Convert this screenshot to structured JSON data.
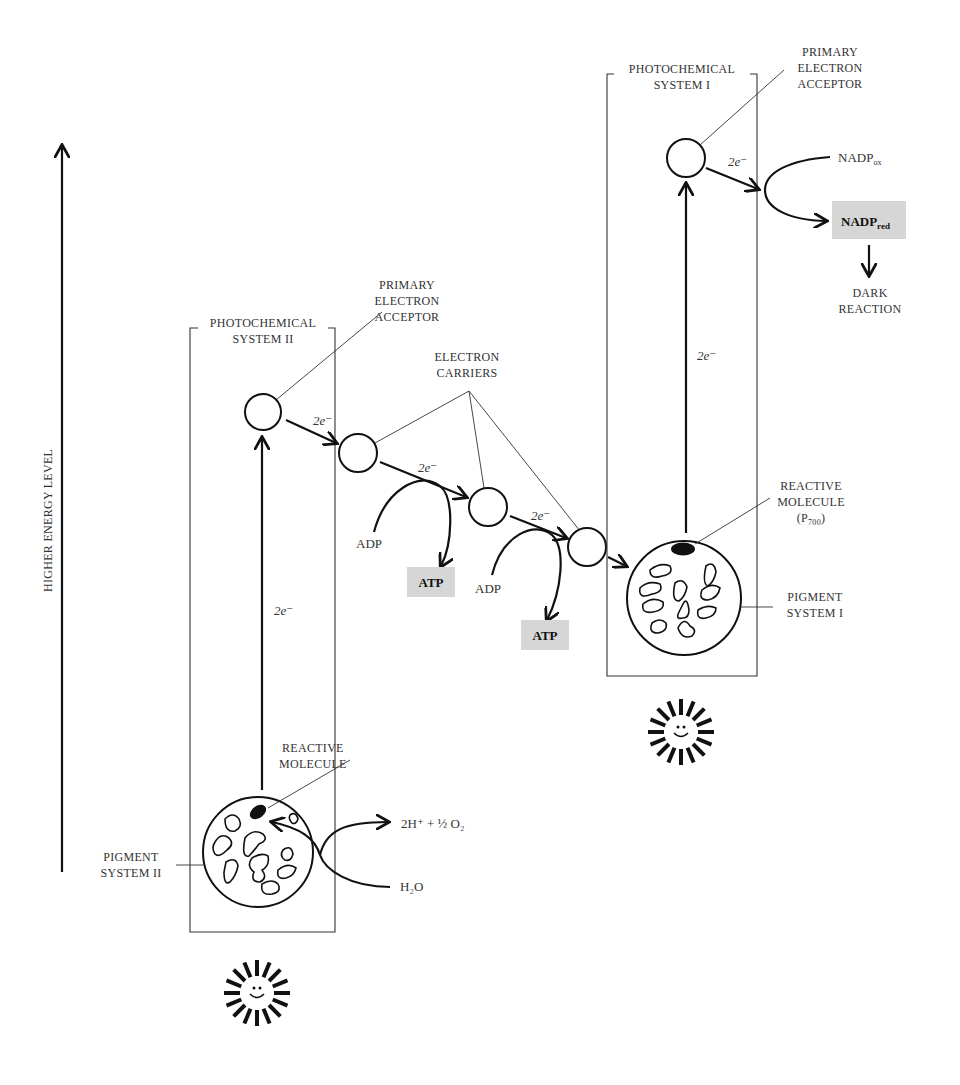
{
  "axis": {
    "label": "HIGHER ENERGY LEVEL",
    "direction": "up"
  },
  "photosystem_ii": {
    "title_line1": "PHOTOCHEMICAL",
    "title_line2": "SYSTEM II",
    "acceptor_label_line1": "PRIMARY",
    "acceptor_label_line2": "ELECTRON",
    "acceptor_label_line3": "ACCEPTOR",
    "excitation_label": "2e⁻",
    "reactive_label_line1": "REACTIVE",
    "reactive_label_line2": "MOLECULE",
    "pigment_label_line1": "PIGMENT",
    "pigment_label_line2": "SYSTEM II",
    "water_in": "H₂O",
    "water_out": "2H⁺ + ½ O₂"
  },
  "electron_transport": {
    "carriers_label_line1": "ELECTRON",
    "carriers_label_line2": "CARRIERS",
    "transfer_labels": [
      "2e⁻",
      "2e⁻",
      "2e⁻"
    ],
    "phosphorylation": [
      {
        "input": "ADP",
        "output": "ATP"
      },
      {
        "input": "ADP",
        "output": "ATP"
      }
    ]
  },
  "photosystem_i": {
    "title_line1": "PHOTOCHEMICAL",
    "title_line2": "SYSTEM I",
    "acceptor_label_line1": "PRIMARY",
    "acceptor_label_line2": "ELECTRON",
    "acceptor_label_line3": "ACCEPTOR",
    "excitation_label": "2e⁻",
    "output_transfer_label": "2e⁻",
    "reactive_label_line1": "REACTIVE",
    "reactive_label_line2": "MOLECULE",
    "reactive_label_line3": "(P700)",
    "pigment_label_line1": "PIGMENT",
    "pigment_label_line2": "SYSTEM I",
    "nadp_ox": "NADPox",
    "nadp_red": "NADPred",
    "downstream_line1": "DARK",
    "downstream_line2": "REACTION"
  },
  "light_sources": [
    {
      "name": "sun-ps-ii",
      "icon": "smiling-sun-icon"
    },
    {
      "name": "sun-ps-i",
      "icon": "smiling-sun-icon"
    }
  ],
  "colors": {
    "ink": "#111111",
    "text": "#333333",
    "highlight_box": "#d6d6d6",
    "background": "#ffffff"
  }
}
